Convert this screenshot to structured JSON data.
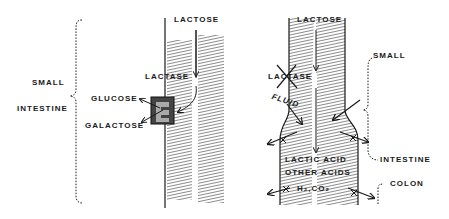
{
  "diagram": {
    "left_panel": {
      "labels": {
        "lactose": "LACTOSE",
        "lactase": "LACTASE",
        "glucose": "GLUCOSE",
        "galactose": "GALACTOSE",
        "small": "SMALL",
        "intestine": "INTESTINE"
      }
    },
    "right_panel": {
      "labels": {
        "lactose": "LACTOSE",
        "lactase": "LACTASE",
        "fluid": "FLUID",
        "lactic_acid": "LACTIC ACID",
        "other_acids": "OTHER ACIDS",
        "gases": "H₂,CO₂",
        "small": "SMALL",
        "intestine": "INTESTINE",
        "colon": "COLON"
      }
    },
    "colors": {
      "ink": "#1a1a1a",
      "hatch": "#555555",
      "background": "#ffffff"
    }
  }
}
